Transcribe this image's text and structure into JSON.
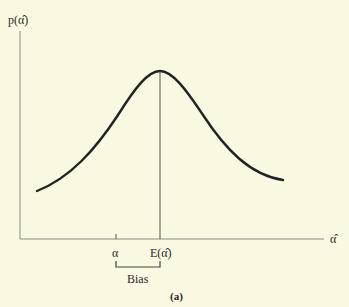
{
  "figure": {
    "caption": "(a)",
    "y_axis_label": "p(α̂)",
    "x_axis_label": "α̂",
    "tick_alpha": "α",
    "tick_expectation": "E(α̂)",
    "bias_label": "Bias"
  },
  "colors": {
    "background": "#fbf8e2",
    "curve": "#222222",
    "axis": "#777777"
  }
}
